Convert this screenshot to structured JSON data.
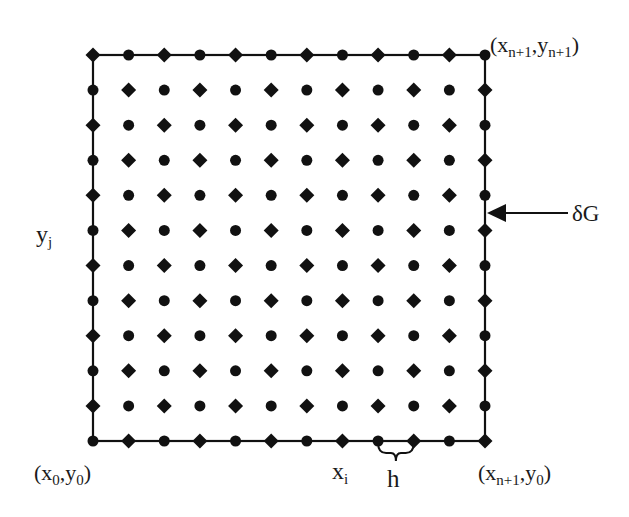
{
  "diagram": {
    "type": "finite-difference-grid",
    "grid": {
      "cols": 12,
      "rows": 12,
      "x_start": 93,
      "x_end": 485,
      "y_top": 55,
      "y_bottom": 441,
      "pattern": "checkerboard",
      "top_left_marker": "diamond",
      "marker_types": [
        "diamond",
        "circle"
      ],
      "boundary_line_color": "#111111",
      "marker_color": "#111111"
    },
    "labels": {
      "top_right": {
        "var_x": "x",
        "sub_x": "n+1",
        "var_y": "y",
        "sub_y": "n+1"
      },
      "bottom_left": {
        "var_x": "x",
        "sub_x": "0",
        "var_y": "y",
        "sub_y": "0"
      },
      "bottom_right": {
        "var_x": "x",
        "sub_x": "n+1",
        "var_y": "y",
        "sub_y": "0"
      },
      "x_i": {
        "var": "x",
        "sub": "i"
      },
      "y_j": {
        "var": "y",
        "sub": "j"
      },
      "spacing": "h",
      "boundary": "δG"
    }
  }
}
